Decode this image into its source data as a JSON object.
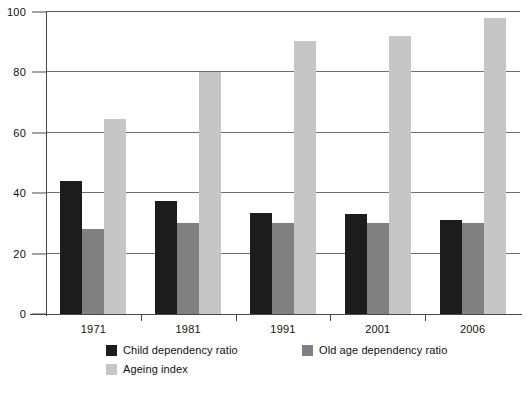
{
  "chart_data": {
    "type": "bar",
    "title": "",
    "subtitle": "",
    "xlabel": "",
    "ylabel": "",
    "categories": [
      "1971",
      "1981",
      "1991",
      "2001",
      "2006"
    ],
    "series": [
      {
        "name": "Child dependency ratio",
        "color": "#1c1c1c",
        "values": [
          44,
          37.5,
          33.5,
          33,
          31
        ]
      },
      {
        "name": "Old age dependency ratio",
        "color": "#808080",
        "values": [
          28,
          30,
          30,
          30,
          30
        ]
      },
      {
        "name": "Ageing index",
        "color": "#c6c6c6",
        "values": [
          64.5,
          80,
          90.5,
          92,
          98
        ]
      }
    ],
    "ylim": [
      0,
      100
    ],
    "yticks": [
      0,
      20,
      40,
      60,
      80,
      100
    ],
    "ytick_labels": [
      "0",
      "20",
      "40",
      "60",
      "80",
      "100"
    ],
    "grid": true,
    "grid_axis": "y",
    "legend_position": "bottom"
  },
  "legend": {
    "items": [
      {
        "label": "Child dependency ratio"
      },
      {
        "label": "Old age dependency ratio"
      },
      {
        "label": "Ageing index"
      }
    ]
  }
}
